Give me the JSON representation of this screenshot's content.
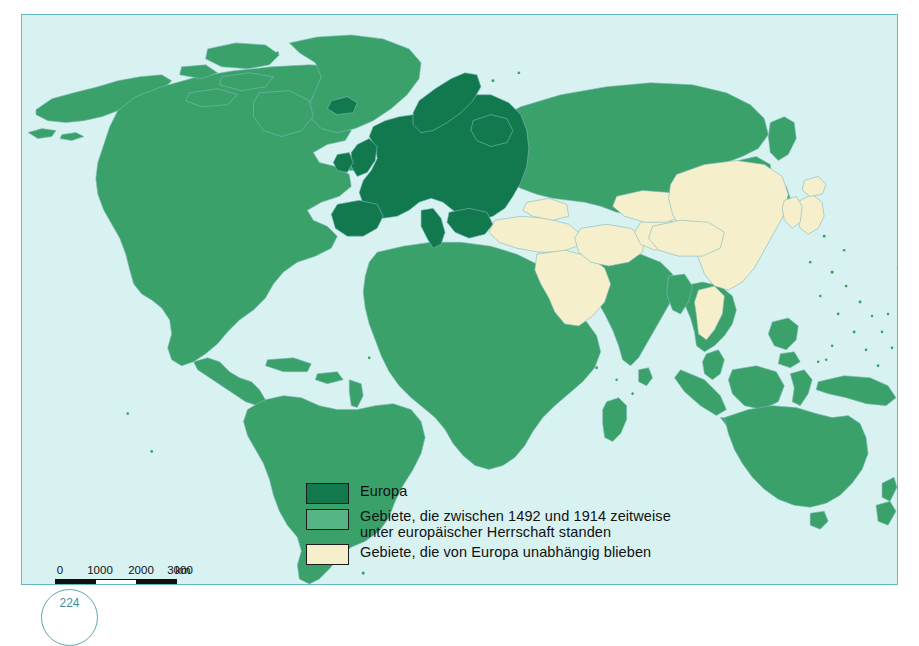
{
  "map": {
    "title": "Europäische Herrschaft über die Welt 1492-1914",
    "ocean_color": "#d8f2f2",
    "frame_color": "#63b9bd",
    "colors": {
      "europe": "#12794f",
      "ruled_by_europe": "#56b585",
      "independent": "#f6efcb",
      "coastline": "#7fb8bd"
    }
  },
  "legend": {
    "items": [
      {
        "id": "europe",
        "label": "Europa",
        "color": "#12794f"
      },
      {
        "id": "ruled",
        "label": "Gebiete, die zwischen 1492 und 1914 zeitweise\nunter europäischer Herrschaft standen",
        "color": "#56b585"
      },
      {
        "id": "independent",
        "label": "Gebiete, die von Europa unabhängig blieben",
        "color": "#f6efcb"
      }
    ]
  },
  "scale": {
    "ticks": [
      "0",
      "1000",
      "2000",
      "3000"
    ],
    "unit": "km"
  },
  "page_number": "224",
  "regions": {
    "europe": [
      "Europa"
    ],
    "independent": [
      "Osmanisches Reich / Türkei",
      "Arabische Halbinsel",
      "Persien",
      "Afghanistan",
      "China",
      "Tibet",
      "Mongolei",
      "Siam / Thailand",
      "Japan",
      "Korea"
    ],
    "ruled": [
      "Nordamerika",
      "Südamerika",
      "Afrika",
      "Indien",
      "Sibirien / Russland",
      "Südostasien",
      "Australien",
      "Neuseeland",
      "Grönland"
    ]
  }
}
